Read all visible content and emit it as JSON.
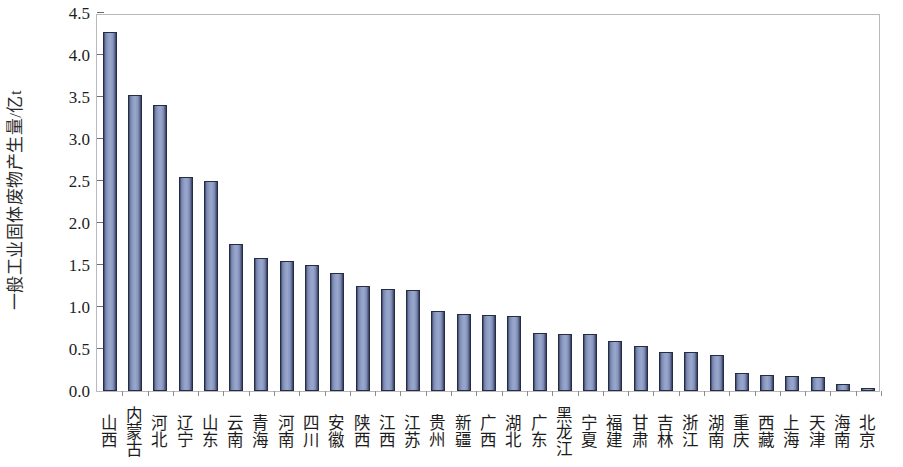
{
  "chart_data": {
    "type": "bar",
    "title": "",
    "subtitle": "",
    "xlabel": "",
    "ylabel": "一般工业固体废物产生量/亿t",
    "ylim": [
      0.0,
      4.5
    ],
    "ytick_step": 0.5,
    "ytick_labels": [
      "4.5",
      "4.0",
      "3.5",
      "3.0",
      "2.5",
      "2.0",
      "1.5",
      "1.0",
      "0.5",
      "0.0"
    ],
    "ytick_values": [
      4.5,
      4.0,
      3.5,
      3.0,
      2.5,
      2.0,
      1.5,
      1.0,
      0.5,
      0.0
    ],
    "grid": false,
    "legend": false,
    "legend_position": "none",
    "bar_color": "#93a1c6",
    "bar_edge_color": "#262c42",
    "frame_color": "#b9b9bd",
    "categories": [
      "山西",
      "内蒙古",
      "河北",
      "辽宁",
      "山东",
      "云南",
      "青海",
      "河南",
      "四川",
      "安徽",
      "陕西",
      "江西",
      "江苏",
      "贵州",
      "新疆",
      "广西",
      "湖北",
      "广东",
      "黑龙江",
      "宁夏",
      "福建",
      "甘肃",
      "吉林",
      "浙江",
      "湖南",
      "重庆",
      "西藏",
      "上海",
      "天津",
      "海南",
      "北京"
    ],
    "values": [
      4.27,
      3.52,
      3.41,
      2.55,
      2.5,
      1.75,
      1.58,
      1.55,
      1.5,
      1.4,
      1.25,
      1.22,
      1.2,
      0.95,
      0.92,
      0.9,
      0.89,
      0.69,
      0.68,
      0.68,
      0.6,
      0.54,
      0.47,
      0.46,
      0.43,
      0.22,
      0.19,
      0.18,
      0.17,
      0.08,
      0.03
    ]
  }
}
